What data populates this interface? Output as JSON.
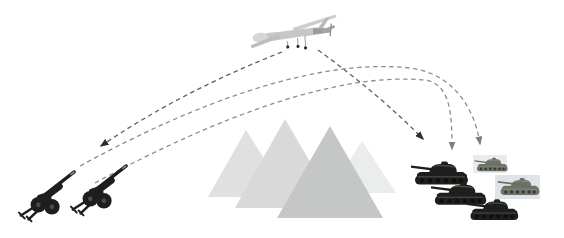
{
  "scene": {
    "kind": "military-targeting-diagram",
    "description": "UAV relays target coordinates; artillery fires indirect arcs over a mountain range at a tank group",
    "background": "#ffffff"
  },
  "colors": {
    "background": "#ffffff",
    "sensor_line": "#5f5f5f",
    "fire_arc": "#8d8d8d",
    "arrowhead_dark": "#2e2e2e",
    "arrowhead_gray": "#7e7e7e",
    "mountain_far_left": "#dfe0df",
    "mountain_mid_left": "#d8d9d8",
    "mountain_front": "#c5c7c6",
    "mountain_far_right": "#ebecec",
    "dark_vehicle": "#1e1e1c",
    "light_tank": "#6d7166",
    "tank_patch_top": "#e9ecec",
    "tank_patch_mid": "#dfe4e8",
    "uav_body": "#c6c6c6",
    "uav_tail": "#9a9a9a"
  },
  "entities": {
    "uav": {
      "label": "reconnaissance-drone",
      "count": 1
    },
    "howitzers": {
      "label": "towed-artillery",
      "count": 2
    },
    "tanks_dark": {
      "label": "tank",
      "count": 3
    },
    "tanks_light": {
      "label": "tank-on-photo-patch",
      "count": 2
    },
    "mountains": {
      "label": "mountain",
      "count": 4
    }
  },
  "arrows": [
    {
      "name": "sensor-link-artillery",
      "from": "uav",
      "to": "howitzers",
      "style": "dashed"
    },
    {
      "name": "sensor-link-tanks",
      "from": "uav",
      "to": "tanks",
      "style": "dashed"
    },
    {
      "name": "fire-arc-1",
      "from": "howitzer-1",
      "to": "tanks",
      "style": "dashed-ballistic"
    },
    {
      "name": "fire-arc-2",
      "from": "howitzer-2",
      "to": "tanks",
      "style": "dashed-ballistic"
    }
  ]
}
